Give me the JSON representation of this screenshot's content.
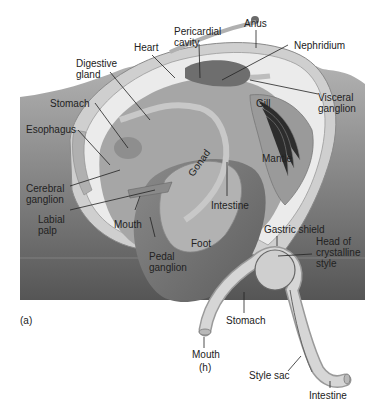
{
  "figure": {
    "panel_a_label": "(a)",
    "panel_b_label": "(h)"
  },
  "colors": {
    "sediment_dark": "#5c5c5c",
    "sediment_light": "#a8a8a8",
    "shell": "#e8e8e8",
    "mantle": "#d4d4d4",
    "foot": "#7a7a7a",
    "gonad": "#9c9c9c",
    "intestine": "#b8b8b8",
    "gill": "#a0a0a0",
    "heart": "#6a6a6a",
    "stomach_b": "#c4c4c4",
    "leader": "#222222"
  },
  "labels_a": {
    "heart": "Heart",
    "pericardial_cavity": "Pericardial\ncavity",
    "anus": "Anus",
    "nephridium": "Nephridium",
    "digestive_gland": "Digestive\ngland",
    "stomach": "Stomach",
    "esophagus": "Esophagus",
    "visceral_ganglion": "Visceral\nganglion",
    "gill": "Gill",
    "mantle": "Mantle",
    "gonad": "Gonad",
    "cerebral_ganglion": "Cerebral\nganglion",
    "labial_palp": "Labial\npalp",
    "intestine": "Intestine",
    "mouth": "Mouth",
    "pedal_ganglion": "Pedal\nganglion",
    "foot": "Foot"
  },
  "labels_b": {
    "gastric_shield": "Gastric shield",
    "head_of_crystalline_style": "Head of\ncrystalline\nstyle",
    "stomach": "Stomach",
    "mouth": "Mouth",
    "style_sac": "Style sac",
    "intestine": "Intestine"
  }
}
